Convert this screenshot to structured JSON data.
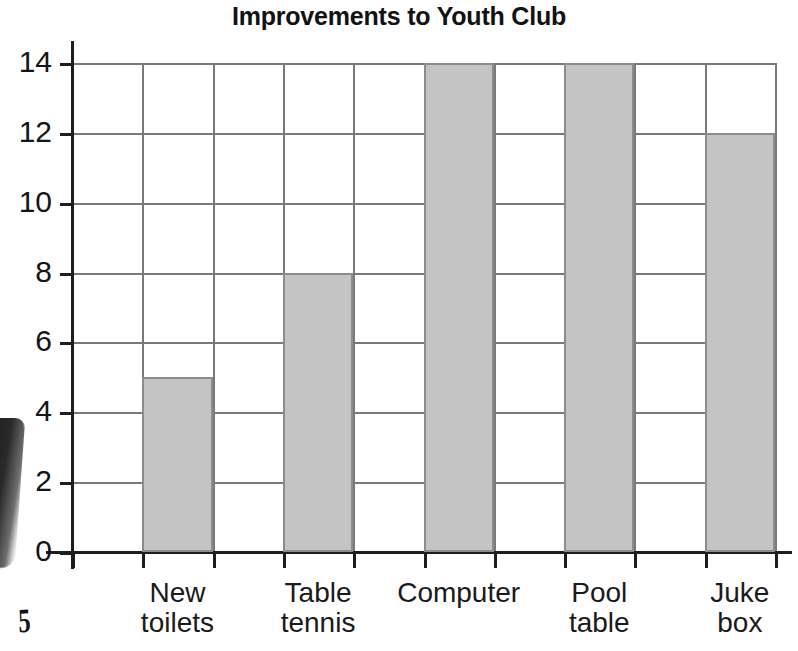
{
  "chart_data": {
    "type": "bar",
    "title": "Improvements to Youth Club",
    "xlabel": "",
    "ylabel": "",
    "categories": [
      "New toilets",
      "Table tennis",
      "Computer",
      "Pool table",
      "Juke box"
    ],
    "category_lines": [
      [
        "New",
        "toilets"
      ],
      [
        "Table",
        "tennis"
      ],
      [
        "Computer",
        ""
      ],
      [
        "Pool",
        "table"
      ],
      [
        "Juke",
        "box"
      ]
    ],
    "values": [
      5,
      8,
      14,
      14,
      12
    ],
    "ylim": [
      0,
      14
    ],
    "y_ticks": [
      0,
      2,
      4,
      6,
      8,
      10,
      12,
      14
    ],
    "y_tick_labels": [
      "0",
      "2",
      "4",
      "6",
      "8",
      "10",
      "12",
      "14"
    ],
    "grid": true,
    "grid_columns": 10,
    "legend": null,
    "bar_fill_color": "#c4c4c4",
    "bar_border_color": "#8a8c8d",
    "grid_color": "#77797a",
    "axis_color": "#1d1d1d",
    "text_color": "#151515"
  },
  "artifacts": {
    "margin_glyph": "5"
  }
}
